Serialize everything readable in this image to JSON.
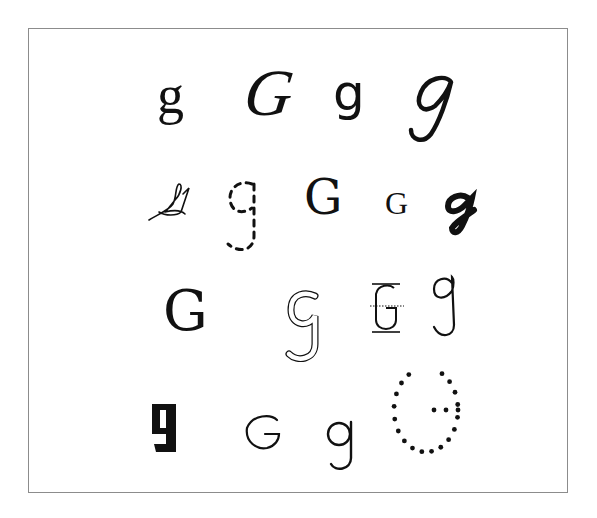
{
  "ink_color": "#111111",
  "frame_color": "#8c8c8c",
  "rows": [
    {
      "glyphs": [
        {
          "char": "g",
          "style": "serif-lowercase"
        },
        {
          "char": "G",
          "style": "italic-serif-uppercase"
        },
        {
          "char": "g",
          "style": "sans-serif-lowercase"
        },
        {
          "char": "g",
          "style": "italic-script-lowercase"
        }
      ]
    },
    {
      "glyphs": [
        {
          "char": "G",
          "style": "handwritten-scribble"
        },
        {
          "char": "g",
          "style": "dashed-trace"
        },
        {
          "char": "G",
          "style": "slab-serif-uppercase"
        },
        {
          "char": "G",
          "style": "small-serif-uppercase"
        },
        {
          "char": "g",
          "style": "bold-brush-script"
        }
      ]
    },
    {
      "glyphs": [
        {
          "char": "G",
          "style": "slab-serif-uppercase-large"
        },
        {
          "char": "g",
          "style": "outline-double-stroke"
        },
        {
          "char": "G",
          "style": "guideline-practice"
        },
        {
          "char": "g",
          "style": "handwritten-lowercase"
        }
      ]
    },
    {
      "glyphs": [
        {
          "char": "g",
          "style": "black-pixel-bold"
        },
        {
          "char": "G",
          "style": "geometric-sans-uppercase"
        },
        {
          "char": "g",
          "style": "geometric-sans-lowercase"
        },
        {
          "char": "G",
          "style": "dotted-trace"
        }
      ]
    }
  ]
}
